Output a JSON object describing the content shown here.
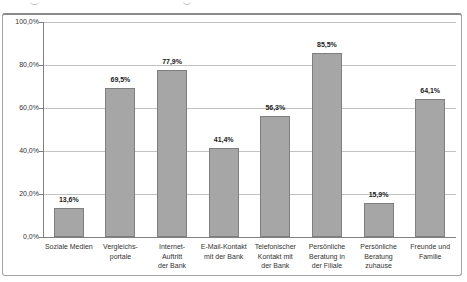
{
  "chart_data": {
    "type": "bar",
    "title": "",
    "xlabel": "",
    "ylabel": "",
    "categories": [
      "Soziale Medien",
      "Vergleichs-\nportale",
      "Internet-\nAuftritt\nder Bank",
      "E-Mail-Kontakt\nmit der Bank",
      "Telefonischer\nKontakt mit\nder Bank",
      "Persönliche\nBeratung in\nder Filiale",
      "Persönliche\nBeratung\nzuhause",
      "Freunde und\nFamilie"
    ],
    "values": [
      13.6,
      69.5,
      77.9,
      41.4,
      56.3,
      85.5,
      15.9,
      64.1
    ],
    "value_labels": [
      "13,6%",
      "69,5%",
      "77,9%",
      "41,4%",
      "56,3%",
      "85,5%",
      "15,9%",
      "64,1%"
    ],
    "y_tick_values": [
      0,
      20,
      40,
      60,
      80,
      100
    ],
    "y_tick_labels": [
      "0,0%",
      "20,0%",
      "40,0%",
      "60,0%",
      "80,0%",
      "100,0%"
    ],
    "ylim": [
      0,
      100
    ],
    "grid": true,
    "legend": false,
    "colors": {
      "bar_fill": "#a6a6a6",
      "bar_border": "#7f7f7f",
      "gridline": "#c2c2c2",
      "axis": "#808080",
      "frame_border": "#a3a3a3",
      "text": "#333333",
      "background": "#ffffff"
    }
  }
}
